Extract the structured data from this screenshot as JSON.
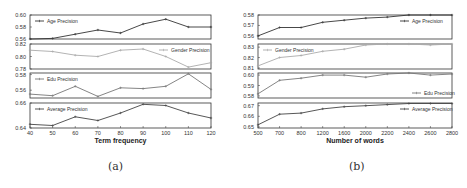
{
  "captions": {
    "a": "(a)",
    "b": "(b)"
  },
  "chart_data": [
    {
      "id": "a",
      "type": "line",
      "title": "",
      "caption": "(a)",
      "xlabel": "Term frequency",
      "x": [
        40,
        50,
        60,
        70,
        80,
        90,
        100,
        110,
        120
      ],
      "xticks": [
        "40",
        "50",
        "60",
        "70",
        "80",
        "90",
        "100",
        "110",
        "120"
      ],
      "grid": false,
      "panels": [
        {
          "name": "Age Precision",
          "color": "#333333",
          "legend_pos": "upper-left",
          "ylim": [
            0.56,
            0.6
          ],
          "yticks": [
            "0.56",
            "0.58",
            "0.60"
          ],
          "values": [
            0.56,
            0.561,
            0.568,
            0.575,
            0.57,
            0.585,
            0.593,
            0.58,
            0.58
          ]
        },
        {
          "name": "Gender Precision",
          "color": "#aaaaaa",
          "legend_pos": "upper-right",
          "ylim": [
            0.78,
            0.82
          ],
          "yticks": [
            "0.78",
            "0.80",
            "0.82"
          ],
          "values": [
            0.81,
            0.808,
            0.802,
            0.8,
            0.81,
            0.812,
            0.8,
            0.783,
            0.79
          ]
        },
        {
          "name": "Edu Precision",
          "color": "#777777",
          "legend_pos": "upper-left",
          "ylim": [
            0.55,
            0.582
          ],
          "yticks": [
            "0.56",
            "0.58"
          ],
          "values": [
            0.555,
            0.553,
            0.565,
            0.552,
            0.563,
            0.562,
            0.565,
            0.581,
            0.561
          ]
        },
        {
          "name": "Average Precision",
          "color": "#444444",
          "legend_pos": "upper-left",
          "ylim": [
            0.64,
            0.66
          ],
          "yticks": [
            "0.64",
            "0.66"
          ],
          "values": [
            0.643,
            0.642,
            0.649,
            0.646,
            0.652,
            0.659,
            0.658,
            0.652,
            0.648
          ]
        }
      ]
    },
    {
      "id": "b",
      "type": "line",
      "title": "",
      "caption": "(b)",
      "xlabel": "Number of words",
      "x": [
        500,
        700,
        800,
        1200,
        1600,
        2000,
        2200,
        2400,
        2600,
        2800
      ],
      "xticks": [
        "500",
        "700",
        "800",
        "1200",
        "1600",
        "2000",
        "2200",
        "2400",
        "2600",
        "2800"
      ],
      "grid": false,
      "panels": [
        {
          "name": "Age Precision",
          "color": "#333333",
          "legend_pos": "upper-right",
          "ylim": [
            0.557,
            0.58
          ],
          "yticks": [
            "0.56",
            "0.57",
            "0.58"
          ],
          "values": [
            0.56,
            0.568,
            0.568,
            0.573,
            0.575,
            0.577,
            0.578,
            0.58,
            0.58,
            0.58
          ]
        },
        {
          "name": "Gender Precision",
          "color": "#aaaaaa",
          "legend_pos": "upper-left",
          "ylim": [
            0.809,
            0.833
          ],
          "yticks": [
            "0.81",
            "0.82",
            "0.83"
          ],
          "values": [
            0.812,
            0.82,
            0.822,
            0.826,
            0.828,
            0.832,
            0.833,
            0.833,
            0.832,
            0.833
          ]
        },
        {
          "name": "Edu Precision",
          "color": "#777777",
          "legend_pos": "lower-right",
          "ylim": [
            0.578,
            0.602
          ],
          "yticks": [
            "0.58",
            "0.59",
            "0.60"
          ],
          "values": [
            0.582,
            0.595,
            0.597,
            0.6,
            0.6,
            0.598,
            0.601,
            0.602,
            0.6,
            0.601
          ]
        },
        {
          "name": "Average Precision",
          "color": "#444444",
          "legend_pos": "upper-right",
          "ylim": [
            0.649,
            0.6725
          ],
          "yticks": [
            "0.65",
            "0.66",
            "0.67"
          ],
          "values": [
            0.652,
            0.662,
            0.663,
            0.667,
            0.669,
            0.67,
            0.671,
            0.672,
            0.672,
            0.672
          ]
        }
      ]
    }
  ]
}
